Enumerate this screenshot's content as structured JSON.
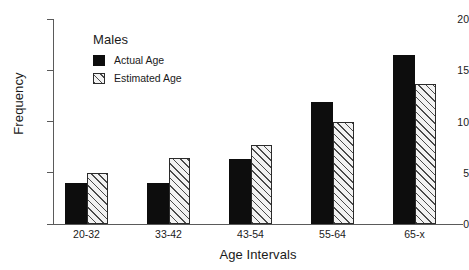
{
  "chart_data": {
    "type": "bar",
    "title": "",
    "xlabel": "Age Intervals",
    "ylabel": "Frequency",
    "categories": [
      "20-32",
      "33-42",
      "43-54",
      "55-64",
      "65-x"
    ],
    "series": [
      {
        "name": "Actual Age",
        "values": [
          4.0,
          4.0,
          6.3,
          11.9,
          16.5
        ],
        "fill": "solid-black",
        "color": "#0d0d0d"
      },
      {
        "name": "Estimated Age",
        "values": [
          5.0,
          6.4,
          7.7,
          10.0,
          13.7
        ],
        "fill": "diagonal-hatch",
        "color": "#f2f2f2"
      }
    ],
    "ylim": [
      0,
      20
    ],
    "yticks": [
      0,
      5,
      10,
      15,
      20
    ],
    "ytick_labels": [
      "0",
      "5",
      "10",
      "15",
      "20"
    ],
    "grid": false,
    "legend": {
      "position": "upper-left-inside",
      "title": "Males",
      "entries": [
        "Actual Age",
        "Estimated Age"
      ]
    }
  },
  "axes": {
    "y_title": "Frequency",
    "x_title": "Age Intervals"
  },
  "legend": {
    "title": "Males",
    "items": [
      {
        "label": "Actual Age"
      },
      {
        "label": "Estimated Age"
      }
    ]
  }
}
